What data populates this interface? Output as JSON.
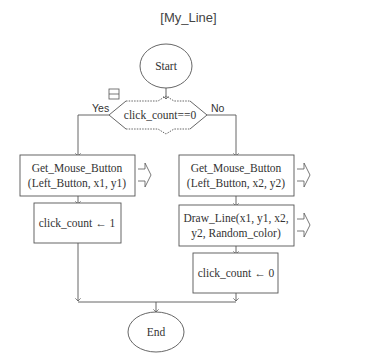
{
  "title": "[My_Line]",
  "nodes": {
    "start": "Start",
    "decision": "click_count==0",
    "yes_label": "Yes",
    "no_label": "No",
    "left_get_line1": "Get_Mouse_Button",
    "left_get_line2": "(Left_Button,  x1,  y1)",
    "left_assign": "click_count ← 1",
    "right_get_line1": "Get_Mouse_Button",
    "right_get_line2": "(Left_Button,  x2,  y2)",
    "right_draw_line1": "Draw_Line(x1,  y1,  x2,",
    "right_draw_line2": "y2,  Random_color)",
    "right_assign": "click_count ← 0",
    "end": "End"
  },
  "colors": {
    "stroke": "#555555",
    "text": "#333333",
    "background": "#ffffff"
  }
}
